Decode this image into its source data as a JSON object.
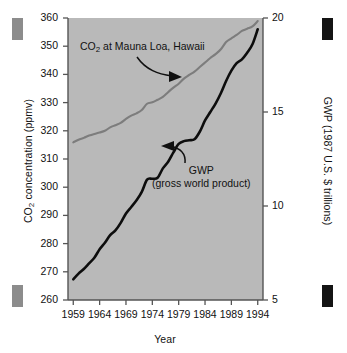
{
  "figure": {
    "plot_background": "#b9b9b9",
    "axis_color": "#555555",
    "co2_line_color": "#7d7d7d",
    "gwp_line_color": "#0d0d0d",
    "corner_markers": [
      {
        "name": "top-left",
        "color": "#8c8c8c"
      },
      {
        "name": "bottom-left",
        "color": "#8c8c8c"
      },
      {
        "name": "top-right",
        "color": "#141414"
      },
      {
        "name": "bottom-right",
        "color": "#141414"
      }
    ]
  },
  "chart_data": {
    "type": "line",
    "title": "",
    "xlabel": "Year",
    "ylabel": "CO2 concentration (ppmv)",
    "ylabel_right": "GWP (1987 U.S. $ trillions)",
    "grid": false,
    "legend_position": "inline-annotations",
    "xlim": [
      1958,
      1995
    ],
    "xticks": [
      1959,
      1964,
      1969,
      1974,
      1979,
      1984,
      1989,
      1994
    ],
    "xtick_labels": [
      "1959",
      "1964",
      "1969",
      "1974",
      "1979",
      "1984",
      "1989",
      "1994"
    ],
    "ylim": [
      260,
      360
    ],
    "yticks": [
      260,
      270,
      280,
      290,
      300,
      310,
      320,
      330,
      340,
      350,
      360
    ],
    "ytick_labels": [
      "260",
      "270",
      "280",
      "290",
      "300",
      "310",
      "320",
      "330",
      "340",
      "350",
      "360"
    ],
    "ylim_right": [
      5,
      20
    ],
    "yticks_right": [
      5,
      10,
      15,
      20
    ],
    "ytick_labels_right": [
      "5",
      "10",
      "15",
      "20"
    ],
    "annotations": [
      {
        "name": "co2-annotation",
        "text": "CO2 at Mauna Loa, Hawaii",
        "text_html": "CO<sub>2</sub> at Mauna Loa, Hawaii",
        "points_to": "co2-series"
      },
      {
        "name": "gwp-annotation",
        "line1": "GWP",
        "line2": "(gross world product)",
        "points_to": "gwp-series"
      }
    ],
    "x": [
      1959,
      1960,
      1961,
      1962,
      1963,
      1964,
      1965,
      1966,
      1967,
      1968,
      1969,
      1970,
      1971,
      1972,
      1973,
      1974,
      1975,
      1976,
      1977,
      1978,
      1979,
      1980,
      1981,
      1982,
      1983,
      1984,
      1985,
      1986,
      1987,
      1988,
      1989,
      1990,
      1991,
      1992,
      1993,
      1994
    ],
    "series": [
      {
        "name": "CO2 at Mauna Loa, Hawaii",
        "axis": "left",
        "unit": "ppmv",
        "color": "#7d7d7d",
        "values": [
          315.9,
          316.8,
          317.5,
          318.3,
          318.9,
          319.4,
          320.0,
          321.2,
          322.0,
          322.8,
          324.2,
          325.4,
          326.2,
          327.4,
          329.6,
          330.1,
          331.0,
          332.0,
          333.7,
          335.3,
          336.7,
          338.5,
          339.8,
          341.0,
          342.6,
          344.2,
          345.8,
          347.2,
          348.9,
          351.5,
          352.8,
          354.0,
          355.4,
          356.2,
          357.0,
          358.9
        ]
      },
      {
        "name": "GWP (gross world product)",
        "axis": "right",
        "unit": "1987 U.S. $ trillions",
        "color": "#0d0d0d",
        "values": [
          6.1,
          6.4,
          6.65,
          6.95,
          7.25,
          7.7,
          8.05,
          8.45,
          8.7,
          9.1,
          9.6,
          9.95,
          10.3,
          10.75,
          11.4,
          11.45,
          11.5,
          12.0,
          12.35,
          12.85,
          13.3,
          13.45,
          13.5,
          13.55,
          13.95,
          14.55,
          15.0,
          15.45,
          16.0,
          16.65,
          17.2,
          17.6,
          17.8,
          18.15,
          18.6,
          19.4
        ]
      }
    ]
  }
}
